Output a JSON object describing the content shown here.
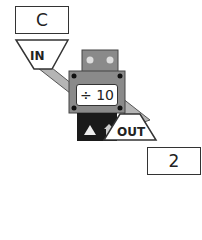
{
  "machine": {
    "input_label": "IN",
    "output_label": "OUT",
    "rule": "÷ 10",
    "input_value": "C",
    "output_value": "2",
    "buttons": [
      "up-triangle",
      "up-arrow"
    ]
  },
  "colors": {
    "body": "#8a8a8a",
    "chute": "#b5b5b5",
    "outline": "#333333",
    "panel": "#1a1a1a"
  }
}
